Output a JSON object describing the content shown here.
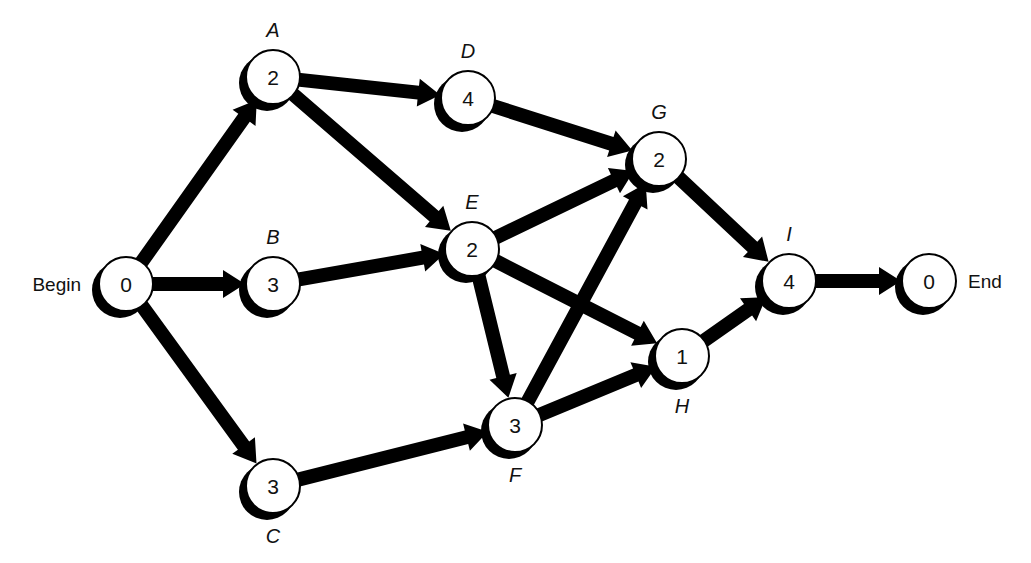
{
  "diagram": {
    "type": "activity-on-node network",
    "background": "#ffffff",
    "ink": "#000000",
    "nodes": [
      {
        "id": "begin",
        "letter": "",
        "value": "0",
        "side_label": "Begin",
        "side": "left",
        "x": 126,
        "y": 284
      },
      {
        "id": "A",
        "letter": "A",
        "value": "2",
        "side_label": "",
        "letter_pos": "above",
        "x": 273,
        "y": 77
      },
      {
        "id": "B",
        "letter": "B",
        "value": "3",
        "side_label": "",
        "letter_pos": "above",
        "x": 273,
        "y": 284
      },
      {
        "id": "C",
        "letter": "C",
        "value": "3",
        "side_label": "",
        "letter_pos": "below",
        "x": 273,
        "y": 486
      },
      {
        "id": "D",
        "letter": "D",
        "value": "4",
        "side_label": "",
        "letter_pos": "above",
        "x": 468,
        "y": 98
      },
      {
        "id": "E",
        "letter": "E",
        "value": "2",
        "side_label": "",
        "letter_pos": "above",
        "x": 472,
        "y": 249
      },
      {
        "id": "F",
        "letter": "F",
        "value": "3",
        "side_label": "",
        "letter_pos": "below",
        "x": 515,
        "y": 425
      },
      {
        "id": "G",
        "letter": "G",
        "value": "2",
        "side_label": "",
        "letter_pos": "above",
        "x": 659,
        "y": 159
      },
      {
        "id": "H",
        "letter": "H",
        "value": "1",
        "side_label": "",
        "letter_pos": "below",
        "x": 682,
        "y": 356
      },
      {
        "id": "I",
        "letter": "I",
        "value": "4",
        "side_label": "",
        "letter_pos": "above",
        "x": 789,
        "y": 281
      },
      {
        "id": "end",
        "letter": "",
        "value": "0",
        "side_label": "End",
        "side": "right",
        "x": 929,
        "y": 281
      }
    ],
    "edges": [
      {
        "from": "begin",
        "to": "A"
      },
      {
        "from": "begin",
        "to": "B"
      },
      {
        "from": "begin",
        "to": "C"
      },
      {
        "from": "A",
        "to": "D"
      },
      {
        "from": "A",
        "to": "E"
      },
      {
        "from": "B",
        "to": "E"
      },
      {
        "from": "C",
        "to": "F"
      },
      {
        "from": "D",
        "to": "G"
      },
      {
        "from": "E",
        "to": "G"
      },
      {
        "from": "E",
        "to": "H"
      },
      {
        "from": "E",
        "to": "F"
      },
      {
        "from": "F",
        "to": "G"
      },
      {
        "from": "F",
        "to": "H"
      },
      {
        "from": "G",
        "to": "I"
      },
      {
        "from": "H",
        "to": "I"
      },
      {
        "from": "I",
        "to": "end"
      }
    ]
  }
}
